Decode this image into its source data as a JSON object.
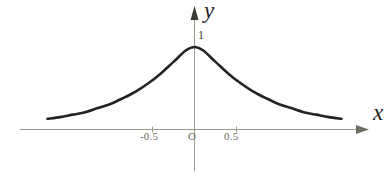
{
  "figure": {
    "background_color": "#ffffff",
    "axis_color": "#9a9a8a",
    "curve_color": "#232323",
    "tick_text_color": "#6d6d60",
    "axis_name_color": "#1d1d1d"
  },
  "axes": {
    "x_axis_label": "x",
    "y_axis_label": "y",
    "origin_label": "O",
    "x_ticks": [
      {
        "value": -0.5,
        "label": "-0.5"
      },
      {
        "value": 0.5,
        "label": "0.5"
      }
    ],
    "y_ticks": [
      {
        "value": 1,
        "label": "1"
      }
    ]
  },
  "chart_data": {
    "type": "line",
    "title": "",
    "xlabel": "x",
    "ylabel": "y",
    "xlim": [
      -1.75,
      1.75
    ],
    "ylim": [
      0,
      1.12
    ],
    "grid": false,
    "legend": null,
    "xticks": [
      -0.5,
      0.5
    ],
    "xticklabels": [
      "-0.5",
      "0.5"
    ],
    "yticks": [
      1
    ],
    "yticklabels": [
      "1"
    ],
    "series": [
      {
        "name": "bell curve",
        "x": [
          -1.75,
          -1.6,
          -1.45,
          -1.3,
          -1.15,
          -1.0,
          -0.85,
          -0.7,
          -0.55,
          -0.4,
          -0.25,
          -0.1,
          0.0,
          0.1,
          0.25,
          0.4,
          0.55,
          0.7,
          0.85,
          1.0,
          1.15,
          1.3,
          1.45,
          1.6,
          1.75
        ],
        "y": [
          0.13,
          0.15,
          0.18,
          0.21,
          0.26,
          0.31,
          0.38,
          0.46,
          0.56,
          0.68,
          0.82,
          0.96,
          1.0,
          0.96,
          0.82,
          0.68,
          0.56,
          0.46,
          0.38,
          0.31,
          0.26,
          0.21,
          0.18,
          0.15,
          0.13
        ]
      }
    ],
    "annotations": [
      {
        "text": "1",
        "x": 0.0,
        "y": 1.0
      },
      {
        "text": "O",
        "x": 0.0,
        "y": 0.0
      }
    ]
  }
}
